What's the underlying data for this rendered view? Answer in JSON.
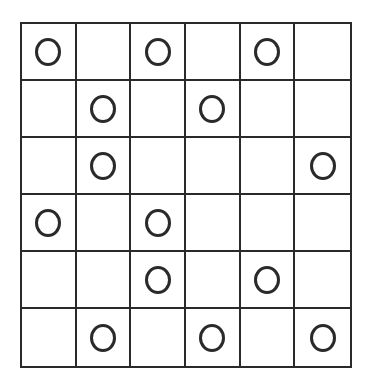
{
  "grid": {
    "rows": 6,
    "cols": 6,
    "line_color": "#2a2a2a",
    "background": "#ffffff",
    "cells": [
      [
        "circle",
        "empty",
        "circle",
        "empty",
        "circle",
        "empty"
      ],
      [
        "empty",
        "circle",
        "empty",
        "circle",
        "empty",
        "empty"
      ],
      [
        "empty",
        "circle",
        "empty",
        "empty",
        "empty",
        "circle"
      ],
      [
        "circle",
        "empty",
        "circle",
        "empty",
        "empty",
        "empty"
      ],
      [
        "empty",
        "empty",
        "circle",
        "empty",
        "circle",
        "empty"
      ],
      [
        "empty",
        "circle",
        "empty",
        "circle",
        "empty",
        "circle"
      ]
    ]
  }
}
